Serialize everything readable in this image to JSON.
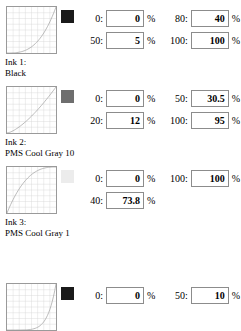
{
  "sections": [
    {
      "id": "ink-1",
      "top": 0,
      "caption_line1": "Ink 1:",
      "caption_line2": "Black",
      "swatch_color": "#1a1a1a",
      "curve_kind": "convex",
      "rows": [
        [
          {
            "label": "0:",
            "value": "0",
            "unit": "%"
          },
          {
            "label": "80:",
            "value": "40",
            "unit": "%"
          }
        ],
        [
          {
            "label": "50:",
            "value": "5",
            "unit": "%"
          },
          {
            "label": "100:",
            "value": "100",
            "unit": "%"
          }
        ]
      ]
    },
    {
      "id": "ink-2",
      "top": 80,
      "caption_line1": "Ink 2:",
      "caption_line2": "PMS Cool Gray 10",
      "swatch_color": "#6e6e6e",
      "curve_kind": "slight-convex",
      "rows": [
        [
          {
            "label": "0:",
            "value": "0",
            "unit": "%"
          },
          {
            "label": "50:",
            "value": "30.5",
            "unit": "%"
          }
        ],
        [
          {
            "label": "20:",
            "value": "12",
            "unit": "%"
          },
          {
            "label": "100:",
            "value": "95",
            "unit": "%"
          }
        ]
      ]
    },
    {
      "id": "ink-3",
      "top": 160,
      "caption_line1": "Ink 3:",
      "caption_line2": "PMS Cool Gray 1",
      "swatch_color": "#ececec",
      "curve_kind": "concave",
      "rows": [
        [
          {
            "label": "0:",
            "value": "0",
            "unit": "%"
          },
          {
            "label": "100:",
            "value": "100",
            "unit": "%"
          }
        ],
        [
          {
            "label": "40:",
            "value": "73.8",
            "unit": "%"
          }
        ]
      ]
    },
    {
      "id": "ink-4",
      "top": 277,
      "caption_line1": "",
      "caption_line2": "",
      "swatch_color": "#1a1a1a",
      "curve_kind": "flat-tail",
      "rows": [
        [
          {
            "label": "0:",
            "value": "0",
            "unit": "%"
          },
          {
            "label": "50:",
            "value": "10",
            "unit": "%"
          }
        ]
      ]
    }
  ],
  "graph": {
    "grid_color": "#d7d7d7",
    "curve_color": "#9a9a9a",
    "border_color": "#9a9a9a",
    "grid_divisions": 8
  }
}
